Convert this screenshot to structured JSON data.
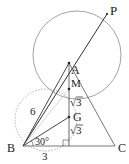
{
  "diagram": {
    "type": "geometry",
    "points": {
      "A": {
        "label": "A",
        "x": 69,
        "y": 63
      },
      "B": {
        "label": "B",
        "x": 23,
        "y": 146
      },
      "C": {
        "label": "C",
        "x": 115,
        "y": 146
      },
      "P": {
        "label": "P",
        "x": 107,
        "y": 14
      },
      "M": {
        "label": "M",
        "x": 69,
        "y": 89
      },
      "G": {
        "label": "G",
        "x": 69,
        "y": 117
      },
      "H": {
        "label": "",
        "x": 69,
        "y": 146
      }
    },
    "labels": {
      "A": "A",
      "B": "B",
      "C": "C",
      "P": "P",
      "M": "M",
      "G": "G",
      "side_BA": "6",
      "side_BH": "3",
      "angle_GBH": "30°",
      "seg_MG_prefix": "√",
      "seg_MG_value": "3",
      "seg_GH_prefix": "√",
      "seg_GH_value": "3"
    },
    "circles": [
      {
        "name": "circumcircle-large",
        "cx": 77,
        "cy": 55,
        "r": 44,
        "style": "solid"
      },
      {
        "name": "auxiliary-circle",
        "cx": 46,
        "cy": 120,
        "r": 31,
        "style": "dotted"
      }
    ],
    "colors": {
      "line": "#333333",
      "circle": "#8a8a8a",
      "dotted": "#9a9a9a",
      "text": "#222222"
    }
  }
}
